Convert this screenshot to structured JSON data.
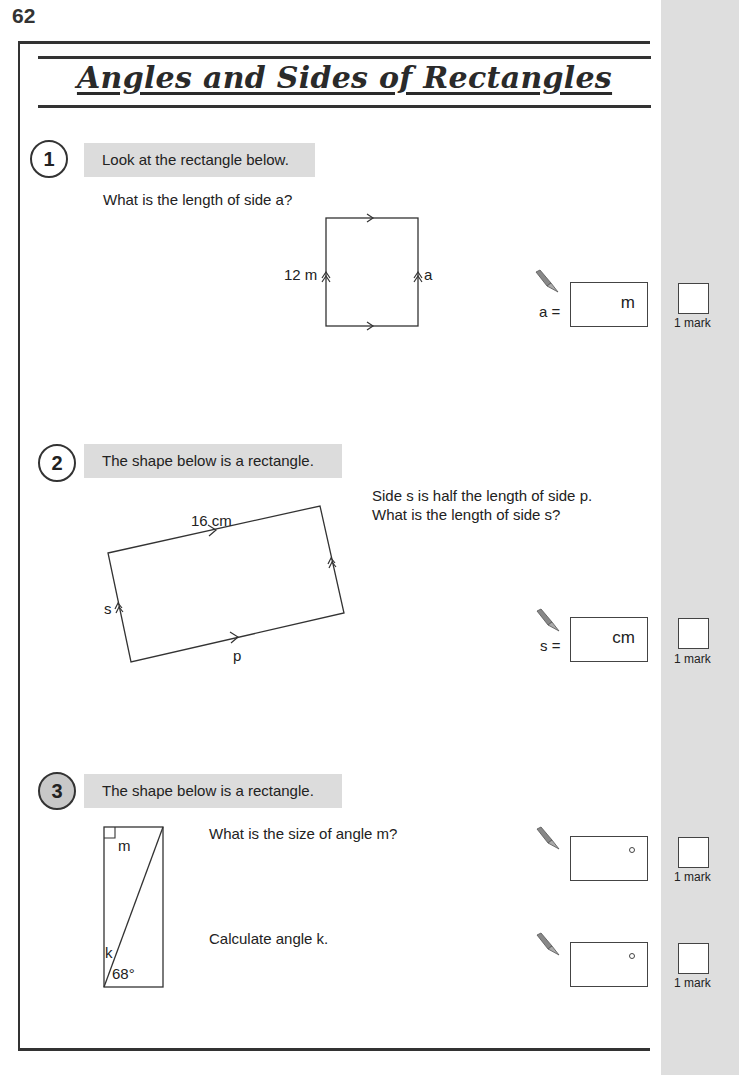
{
  "page": {
    "number": "62",
    "title": "Angles and Sides of Rectangles"
  },
  "questions": [
    {
      "number": "1",
      "instruction": "Look at the rectangle below.",
      "prompt": "What is the length of side a?",
      "diagram": {
        "left_label": "12 m",
        "right_label": "a"
      },
      "answers": [
        {
          "prefix": "a =",
          "unit": "m",
          "value": "",
          "marks": "1 mark"
        }
      ]
    },
    {
      "number": "2",
      "instruction": "The shape below is a rectangle.",
      "prompt_lines": [
        "Side s is half the length of side p.",
        "What is the length of side s?"
      ],
      "diagram": {
        "top_label": "16 cm",
        "left_label": "s",
        "bottom_label": "p"
      },
      "answers": [
        {
          "prefix": "s =",
          "unit": "cm",
          "value": "",
          "marks": "1 mark"
        }
      ]
    },
    {
      "number": "3",
      "instruction": "The shape below is a rectangle.",
      "prompts": [
        "What is the size of angle m?",
        "Calculate angle k."
      ],
      "diagram": {
        "corner_label": "m",
        "angle_label_k": "k",
        "angle_label_given": "68°"
      },
      "answers": [
        {
          "prefix": "",
          "unit": "°",
          "value": "",
          "marks": "1 mark"
        },
        {
          "prefix": "",
          "unit": "°",
          "value": "",
          "marks": "1 mark"
        }
      ]
    }
  ],
  "icons": {
    "pen": "pen-icon",
    "degree": "degree-symbol"
  },
  "colors": {
    "banner": "#dcdcdc",
    "margin": "#dedede",
    "ink": "#333333"
  }
}
